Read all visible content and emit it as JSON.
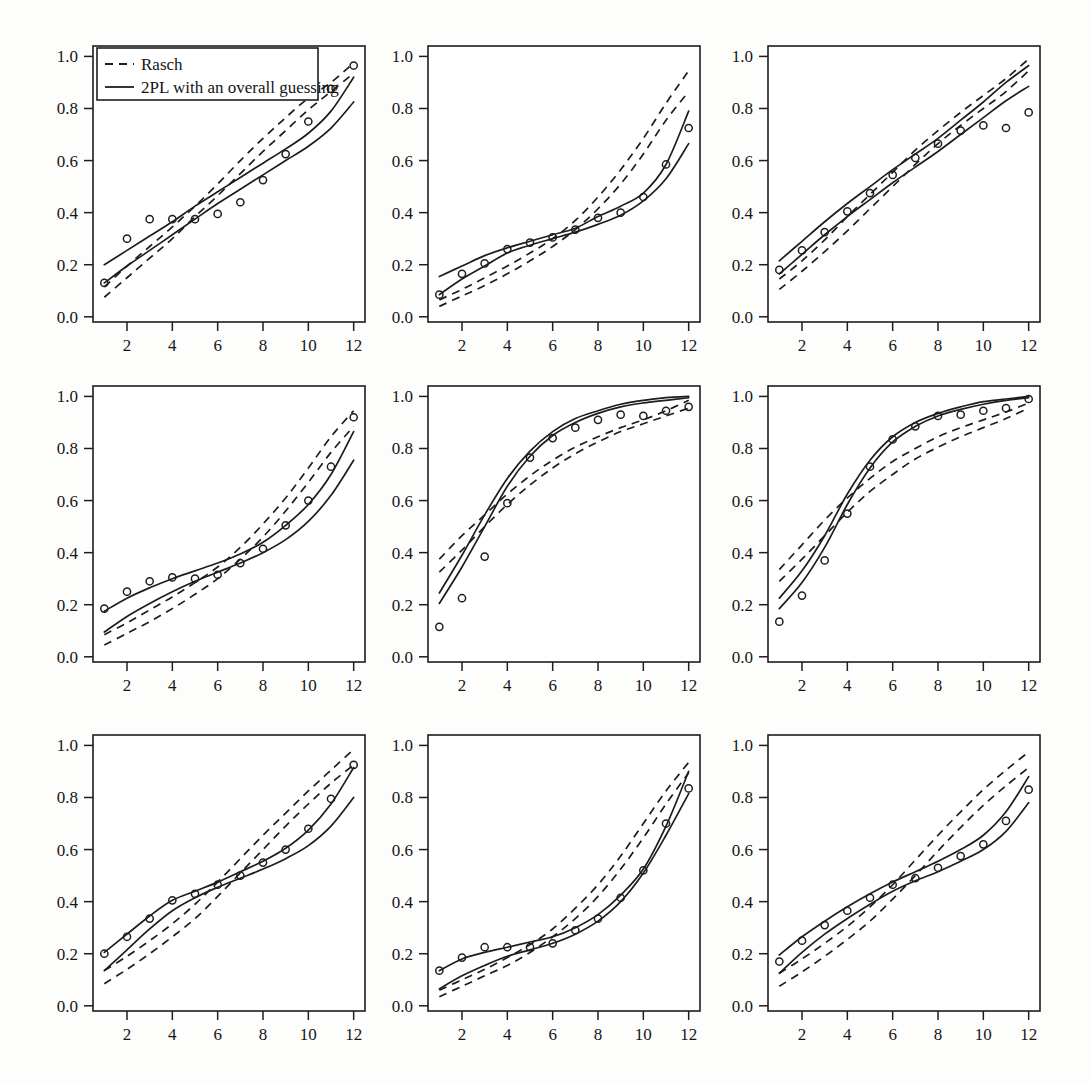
{
  "figure": {
    "title": "",
    "panel_rows": 3,
    "panel_cols": 3,
    "background_color": "#fdfdfc",
    "ink_color": "#1d1d1d"
  },
  "legend": {
    "position": "top-left of first panel",
    "entries": [
      {
        "label": "Rasch",
        "style": "dashed"
      },
      {
        "label": "2PL with an overall guessing",
        "style": "solid"
      }
    ]
  },
  "axes": {
    "x_ticks": [
      "2",
      "4",
      "6",
      "8",
      "10",
      "12"
    ],
    "x_tick_values": [
      2,
      4,
      6,
      8,
      10,
      12
    ],
    "y_ticks": [
      "0.0",
      "0.2",
      "0.4",
      "0.6",
      "0.8",
      "1.0"
    ],
    "y_tick_values": [
      0.0,
      0.2,
      0.4,
      0.6,
      0.8,
      1.0
    ],
    "xlim": [
      0.5,
      12.5
    ],
    "ylim": [
      -0.02,
      1.04
    ],
    "xlabel": "",
    "ylabel": "",
    "grid": false
  },
  "chart_data": [
    {
      "type": "line",
      "panel": 1,
      "title": "",
      "xlabel": "",
      "ylabel": "",
      "xlim": [
        0.5,
        12.5
      ],
      "ylim": [
        -0.02,
        1.04
      ],
      "grid": false,
      "x": [
        1,
        2,
        3,
        4,
        5,
        6,
        7,
        8,
        9,
        10,
        11,
        12
      ],
      "observed": [
        0.13,
        0.3,
        0.375,
        0.375,
        0.375,
        0.395,
        0.44,
        0.525,
        0.625,
        0.75,
        0.875,
        0.965
      ],
      "series": [
        {
          "name": "Rasch upper",
          "style": "dashed",
          "values": [
            0.115,
            0.195,
            0.27,
            0.345,
            0.425,
            0.51,
            0.6,
            0.685,
            0.765,
            0.84,
            0.9,
            0.975
          ]
        },
        {
          "name": "Rasch lower",
          "style": "dashed",
          "values": [
            0.075,
            0.15,
            0.225,
            0.3,
            0.385,
            0.465,
            0.55,
            0.635,
            0.715,
            0.795,
            0.865,
            0.935
          ]
        },
        {
          "name": "2PL upper",
          "style": "solid",
          "values": [
            0.2,
            0.255,
            0.31,
            0.365,
            0.425,
            0.48,
            0.535,
            0.59,
            0.645,
            0.705,
            0.79,
            0.92
          ]
        },
        {
          "name": "2PL lower",
          "style": "solid",
          "values": [
            0.13,
            0.195,
            0.255,
            0.315,
            0.375,
            0.435,
            0.49,
            0.545,
            0.6,
            0.655,
            0.725,
            0.825
          ]
        }
      ]
    },
    {
      "type": "line",
      "panel": 2,
      "title": "",
      "xlabel": "",
      "ylabel": "",
      "xlim": [
        0.5,
        12.5
      ],
      "ylim": [
        -0.02,
        1.04
      ],
      "grid": false,
      "x": [
        1,
        2,
        3,
        4,
        5,
        6,
        7,
        8,
        9,
        10,
        11,
        12
      ],
      "observed": [
        0.085,
        0.165,
        0.205,
        0.26,
        0.285,
        0.305,
        0.335,
        0.38,
        0.4,
        0.46,
        0.585,
        0.725
      ],
      "series": [
        {
          "name": "Rasch upper",
          "style": "dashed",
          "values": [
            0.065,
            0.105,
            0.15,
            0.195,
            0.245,
            0.3,
            0.37,
            0.46,
            0.565,
            0.685,
            0.82,
            0.945
          ]
        },
        {
          "name": "Rasch lower",
          "style": "dashed",
          "values": [
            0.04,
            0.08,
            0.12,
            0.165,
            0.215,
            0.27,
            0.335,
            0.415,
            0.51,
            0.625,
            0.755,
            0.865
          ]
        },
        {
          "name": "2PL upper",
          "style": "solid",
          "values": [
            0.155,
            0.195,
            0.235,
            0.265,
            0.29,
            0.315,
            0.34,
            0.385,
            0.425,
            0.475,
            0.585,
            0.79
          ]
        },
        {
          "name": "2PL lower",
          "style": "solid",
          "values": [
            0.085,
            0.145,
            0.195,
            0.245,
            0.275,
            0.3,
            0.325,
            0.355,
            0.39,
            0.445,
            0.53,
            0.665
          ]
        }
      ]
    },
    {
      "type": "line",
      "panel": 3,
      "title": "",
      "xlabel": "",
      "ylabel": "",
      "xlim": [
        0.5,
        12.5
      ],
      "ylim": [
        -0.02,
        1.04
      ],
      "grid": false,
      "x": [
        1,
        2,
        3,
        4,
        5,
        6,
        7,
        8,
        9,
        10,
        11,
        12
      ],
      "observed": [
        0.18,
        0.255,
        0.325,
        0.405,
        0.475,
        0.545,
        0.61,
        0.665,
        0.715,
        0.735,
        0.725,
        0.785
      ],
      "series": [
        {
          "name": "Rasch upper",
          "style": "dashed",
          "values": [
            0.145,
            0.215,
            0.295,
            0.385,
            0.47,
            0.555,
            0.64,
            0.715,
            0.785,
            0.85,
            0.915,
            0.99
          ]
        },
        {
          "name": "Rasch lower",
          "style": "dashed",
          "values": [
            0.105,
            0.175,
            0.25,
            0.33,
            0.415,
            0.5,
            0.585,
            0.665,
            0.735,
            0.8,
            0.865,
            0.945
          ]
        },
        {
          "name": "2PL upper",
          "style": "solid",
          "values": [
            0.215,
            0.29,
            0.365,
            0.435,
            0.5,
            0.565,
            0.625,
            0.685,
            0.755,
            0.825,
            0.9,
            0.965
          ]
        },
        {
          "name": "2PL lower",
          "style": "solid",
          "values": [
            0.165,
            0.24,
            0.315,
            0.385,
            0.45,
            0.515,
            0.575,
            0.635,
            0.7,
            0.765,
            0.83,
            0.885
          ]
        }
      ]
    },
    {
      "type": "line",
      "panel": 4,
      "title": "",
      "xlabel": "",
      "ylabel": "",
      "xlim": [
        0.5,
        12.5
      ],
      "ylim": [
        -0.02,
        1.04
      ],
      "grid": false,
      "x": [
        1,
        2,
        3,
        4,
        5,
        6,
        7,
        8,
        9,
        10,
        11,
        12
      ],
      "observed": [
        0.185,
        0.25,
        0.29,
        0.305,
        0.3,
        0.315,
        0.36,
        0.415,
        0.505,
        0.6,
        0.73,
        0.92
      ],
      "series": [
        {
          "name": "Rasch upper",
          "style": "dashed",
          "values": [
            0.085,
            0.13,
            0.18,
            0.23,
            0.285,
            0.345,
            0.42,
            0.51,
            0.61,
            0.725,
            0.845,
            0.945
          ]
        },
        {
          "name": "Rasch lower",
          "style": "dashed",
          "values": [
            0.045,
            0.09,
            0.135,
            0.185,
            0.24,
            0.3,
            0.375,
            0.46,
            0.56,
            0.67,
            0.785,
            0.885
          ]
        },
        {
          "name": "2PL upper",
          "style": "solid",
          "values": [
            0.175,
            0.225,
            0.265,
            0.3,
            0.33,
            0.36,
            0.395,
            0.44,
            0.505,
            0.585,
            0.7,
            0.865
          ]
        },
        {
          "name": "2PL lower",
          "style": "solid",
          "values": [
            0.095,
            0.155,
            0.205,
            0.25,
            0.29,
            0.325,
            0.36,
            0.4,
            0.45,
            0.52,
            0.62,
            0.755
          ]
        }
      ]
    },
    {
      "type": "line",
      "panel": 5,
      "title": "",
      "xlabel": "",
      "ylabel": "",
      "xlim": [
        0.5,
        12.5
      ],
      "ylim": [
        -0.02,
        1.04
      ],
      "grid": false,
      "x": [
        1,
        2,
        3,
        4,
        5,
        6,
        7,
        8,
        9,
        10,
        11,
        12
      ],
      "observed": [
        0.115,
        0.225,
        0.385,
        0.59,
        0.765,
        0.84,
        0.88,
        0.91,
        0.93,
        0.925,
        0.945,
        0.96
      ],
      "series": [
        {
          "name": "Rasch upper",
          "style": "dashed",
          "values": [
            0.375,
            0.465,
            0.545,
            0.625,
            0.695,
            0.755,
            0.805,
            0.845,
            0.88,
            0.91,
            0.945,
            0.985
          ]
        },
        {
          "name": "Rasch lower",
          "style": "dashed",
          "values": [
            0.325,
            0.41,
            0.5,
            0.585,
            0.66,
            0.725,
            0.78,
            0.825,
            0.865,
            0.895,
            0.925,
            0.955
          ]
        },
        {
          "name": "2PL upper",
          "style": "solid",
          "values": [
            0.245,
            0.39,
            0.545,
            0.685,
            0.79,
            0.865,
            0.915,
            0.945,
            0.97,
            0.985,
            0.995,
            1.0
          ]
        },
        {
          "name": "2PL lower",
          "style": "solid",
          "values": [
            0.205,
            0.345,
            0.5,
            0.655,
            0.77,
            0.85,
            0.9,
            0.935,
            0.96,
            0.975,
            0.985,
            0.995
          ]
        }
      ]
    },
    {
      "type": "line",
      "panel": 6,
      "title": "",
      "xlabel": "",
      "ylabel": "",
      "xlim": [
        0.5,
        12.5
      ],
      "ylim": [
        -0.02,
        1.04
      ],
      "grid": false,
      "x": [
        1,
        2,
        3,
        4,
        5,
        6,
        7,
        8,
        9,
        10,
        11,
        12
      ],
      "observed": [
        0.135,
        0.235,
        0.37,
        0.55,
        0.73,
        0.835,
        0.885,
        0.925,
        0.93,
        0.945,
        0.955,
        0.99
      ],
      "series": [
        {
          "name": "Rasch upper",
          "style": "dashed",
          "values": [
            0.335,
            0.43,
            0.525,
            0.61,
            0.685,
            0.75,
            0.8,
            0.845,
            0.88,
            0.91,
            0.94,
            0.975
          ]
        },
        {
          "name": "Rasch lower",
          "style": "dashed",
          "values": [
            0.29,
            0.375,
            0.465,
            0.555,
            0.635,
            0.7,
            0.76,
            0.805,
            0.845,
            0.88,
            0.915,
            0.955
          ]
        },
        {
          "name": "2PL upper",
          "style": "solid",
          "values": [
            0.225,
            0.33,
            0.465,
            0.625,
            0.755,
            0.845,
            0.9,
            0.935,
            0.96,
            0.98,
            0.99,
            1.0
          ]
        },
        {
          "name": "2PL lower",
          "style": "solid",
          "values": [
            0.185,
            0.285,
            0.42,
            0.585,
            0.725,
            0.825,
            0.885,
            0.925,
            0.95,
            0.97,
            0.985,
            0.995
          ]
        }
      ]
    },
    {
      "type": "line",
      "panel": 7,
      "title": "",
      "xlabel": "",
      "ylabel": "",
      "xlim": [
        0.5,
        12.5
      ],
      "ylim": [
        -0.02,
        1.04
      ],
      "grid": false,
      "x": [
        1,
        2,
        3,
        4,
        5,
        6,
        7,
        8,
        9,
        10,
        11,
        12
      ],
      "observed": [
        0.2,
        0.265,
        0.335,
        0.405,
        0.43,
        0.465,
        0.5,
        0.55,
        0.6,
        0.68,
        0.795,
        0.925
      ],
      "series": [
        {
          "name": "Rasch upper",
          "style": "dashed",
          "values": [
            0.135,
            0.19,
            0.25,
            0.315,
            0.39,
            0.475,
            0.565,
            0.655,
            0.74,
            0.825,
            0.905,
            0.985
          ]
        },
        {
          "name": "Rasch lower",
          "style": "dashed",
          "values": [
            0.085,
            0.14,
            0.2,
            0.265,
            0.335,
            0.42,
            0.51,
            0.6,
            0.69,
            0.775,
            0.855,
            0.925
          ]
        },
        {
          "name": "2PL upper",
          "style": "solid",
          "values": [
            0.205,
            0.275,
            0.345,
            0.405,
            0.44,
            0.475,
            0.515,
            0.555,
            0.605,
            0.675,
            0.775,
            0.915
          ]
        },
        {
          "name": "2PL lower",
          "style": "solid",
          "values": [
            0.135,
            0.215,
            0.295,
            0.365,
            0.415,
            0.455,
            0.49,
            0.525,
            0.565,
            0.615,
            0.69,
            0.8
          ]
        }
      ]
    },
    {
      "type": "line",
      "panel": 8,
      "title": "",
      "xlabel": "",
      "ylabel": "",
      "xlim": [
        0.5,
        12.5
      ],
      "ylim": [
        -0.02,
        1.04
      ],
      "grid": false,
      "x": [
        1,
        2,
        3,
        4,
        5,
        6,
        7,
        8,
        9,
        10,
        11,
        12
      ],
      "observed": [
        0.135,
        0.185,
        0.225,
        0.225,
        0.225,
        0.24,
        0.29,
        0.335,
        0.415,
        0.52,
        0.7,
        0.835
      ],
      "series": [
        {
          "name": "Rasch upper",
          "style": "dashed",
          "values": [
            0.06,
            0.1,
            0.14,
            0.185,
            0.235,
            0.295,
            0.375,
            0.465,
            0.575,
            0.7,
            0.825,
            0.935
          ]
        },
        {
          "name": "Rasch lower",
          "style": "dashed",
          "values": [
            0.035,
            0.075,
            0.115,
            0.155,
            0.205,
            0.265,
            0.335,
            0.42,
            0.525,
            0.645,
            0.775,
            0.895
          ]
        },
        {
          "name": "2PL upper",
          "style": "solid",
          "values": [
            0.135,
            0.18,
            0.205,
            0.225,
            0.245,
            0.265,
            0.3,
            0.35,
            0.425,
            0.525,
            0.69,
            0.9
          ]
        },
        {
          "name": "2PL lower",
          "style": "solid",
          "values": [
            0.065,
            0.115,
            0.155,
            0.19,
            0.215,
            0.24,
            0.275,
            0.325,
            0.4,
            0.51,
            0.655,
            0.815
          ]
        }
      ]
    },
    {
      "type": "line",
      "panel": 9,
      "title": "",
      "xlabel": "",
      "ylabel": "",
      "xlim": [
        0.5,
        12.5
      ],
      "ylim": [
        -0.02,
        1.04
      ],
      "grid": false,
      "x": [
        1,
        2,
        3,
        4,
        5,
        6,
        7,
        8,
        9,
        10,
        11,
        12
      ],
      "observed": [
        0.17,
        0.25,
        0.31,
        0.365,
        0.415,
        0.465,
        0.49,
        0.53,
        0.575,
        0.62,
        0.71,
        0.83
      ],
      "series": [
        {
          "name": "Rasch upper",
          "style": "dashed",
          "values": [
            0.125,
            0.18,
            0.24,
            0.305,
            0.38,
            0.465,
            0.56,
            0.655,
            0.745,
            0.83,
            0.905,
            0.975
          ]
        },
        {
          "name": "Rasch lower",
          "style": "dashed",
          "values": [
            0.075,
            0.13,
            0.19,
            0.255,
            0.325,
            0.41,
            0.5,
            0.595,
            0.685,
            0.77,
            0.845,
            0.915
          ]
        },
        {
          "name": "2PL upper",
          "style": "solid",
          "values": [
            0.195,
            0.265,
            0.325,
            0.38,
            0.43,
            0.475,
            0.515,
            0.555,
            0.6,
            0.655,
            0.745,
            0.88
          ]
        },
        {
          "name": "2PL lower",
          "style": "solid",
          "values": [
            0.125,
            0.205,
            0.275,
            0.335,
            0.39,
            0.44,
            0.48,
            0.515,
            0.555,
            0.6,
            0.67,
            0.78
          ]
        }
      ]
    }
  ]
}
